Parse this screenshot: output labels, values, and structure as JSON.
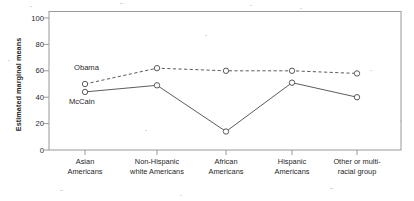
{
  "chart_data": {
    "type": "line",
    "title": "",
    "xlabel": "",
    "ylabel": "Estimated marginal means",
    "ylim": [
      0,
      105
    ],
    "yticks": [
      0,
      20,
      40,
      60,
      80,
      100
    ],
    "grid": false,
    "legend_position": "inline-annotation",
    "categories": [
      "Asian Americans",
      "Non-Hispanic white Americans",
      "African Americans",
      "Hispanic Americans",
      "Other or multi-racial group"
    ],
    "category_lines": [
      [
        "Asian",
        "Americans"
      ],
      [
        "Non-Hispanic",
        "white Americans"
      ],
      [
        "African",
        "Americans"
      ],
      [
        "Hispanic",
        "Americans"
      ],
      [
        "Other or multi-",
        "racial group"
      ]
    ],
    "series": [
      {
        "name": "Obama",
        "style": "dashed",
        "marker": "open-circle",
        "color": "#4a4a4a",
        "values": [
          50,
          62,
          60,
          60,
          58
        ]
      },
      {
        "name": "McCain",
        "style": "solid",
        "marker": "open-circle",
        "color": "#4a4a4a",
        "values": [
          44,
          49,
          14,
          51,
          40
        ]
      }
    ],
    "annotations": [
      {
        "text": "Obama",
        "series": "Obama",
        "near_category": "Asian Americans",
        "position": "above-left"
      },
      {
        "text": "McCain",
        "series": "McCain",
        "near_category": "Asian Americans",
        "position": "below-left"
      }
    ]
  },
  "ytick_labels": [
    "100",
    "80",
    "60",
    "40",
    "20",
    "0"
  ],
  "colors": {
    "frame": "#9a9a9a",
    "line": "#4a4a4a",
    "text": "#1f1f1f",
    "background": "#ffffff"
  }
}
